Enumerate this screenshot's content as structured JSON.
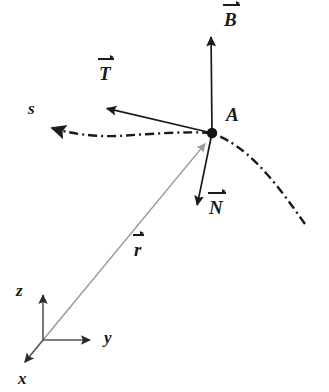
{
  "figure": {
    "background_color": "#ffffff",
    "ink_color": "#1a1a1a",
    "accent_color": "#999999"
  },
  "point": {
    "name": "A",
    "label": "A",
    "x": 212,
    "y": 133
  },
  "curve": {
    "name": "s",
    "label": "s",
    "style": "dash-dot",
    "color": "#1a1a1a",
    "label_x": 28,
    "label_y": 100,
    "arrow_tip_x": 43,
    "arrow_tip_y": 128,
    "path": "M 305 224 C 292 206, 272 176, 248 155 C 234 143, 222 137, 212 133 C 186 131, 150 134, 118 136 C 92 137, 68 133, 52 128",
    "dash_pattern": "9 4 2 4"
  },
  "vectors": [
    {
      "name": "B",
      "label": "B",
      "description": "binormal vector",
      "color": "#1a1a1a",
      "from_x": 212,
      "from_y": 133,
      "to_x": 211,
      "to_y": 31,
      "label_x": 224,
      "label_y": 10
    },
    {
      "name": "T",
      "label": "T",
      "description": "tangent vector",
      "color": "#1a1a1a",
      "from_x": 212,
      "from_y": 133,
      "to_x": 101,
      "to_y": 107,
      "label_x": 99,
      "label_y": 64
    },
    {
      "name": "N",
      "label": "N",
      "description": "principal normal vector",
      "color": "#1a1a1a",
      "from_x": 212,
      "from_y": 133,
      "to_x": 196,
      "to_y": 211,
      "label_x": 209,
      "label_y": 198
    },
    {
      "name": "r",
      "label": "r",
      "description": "position vector from origin to point A",
      "color": "#9a9a9a",
      "from_x": 43,
      "from_y": 340,
      "to_x": 209,
      "to_y": 139,
      "label_x": 134,
      "label_y": 240
    }
  ],
  "axes": {
    "origin_x": 43,
    "origin_y": 340,
    "color": "#555555",
    "items": [
      {
        "name": "z",
        "label": "z",
        "to_x": 43,
        "to_y": 289,
        "label_x": 16,
        "label_y": 282
      },
      {
        "name": "y",
        "label": "y",
        "to_x": 96,
        "to_y": 340,
        "label_x": 104,
        "label_y": 329
      },
      {
        "name": "x",
        "label": "x",
        "to_x": 21,
        "to_y": 367,
        "label_x": 18,
        "label_y": 370
      }
    ]
  }
}
